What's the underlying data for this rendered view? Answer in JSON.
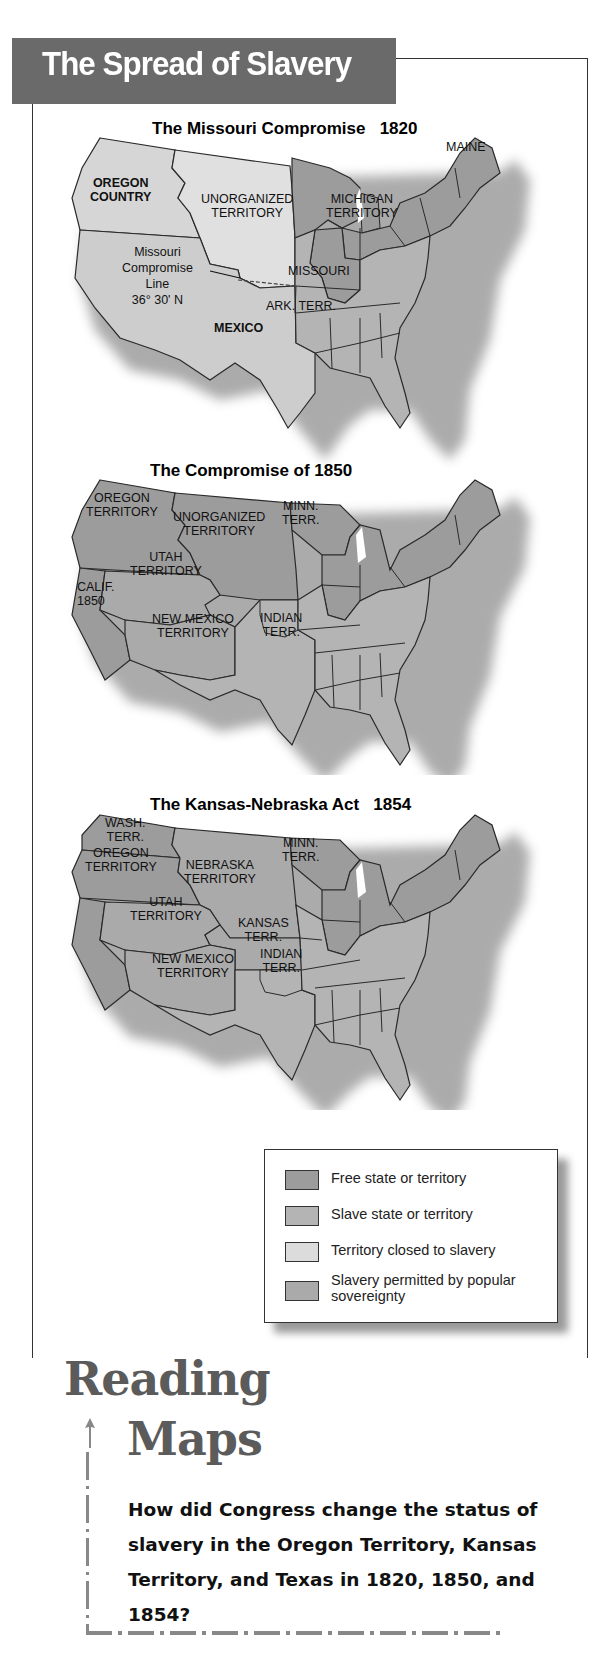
{
  "header": {
    "title": "The Spread of Slavery"
  },
  "colors": {
    "title_bar": "#6a6a6a",
    "free": "#9c9c9c",
    "slave": "#b4b4b4",
    "closed": "#dcdcdc",
    "popular": "#aaaaaa",
    "outline": "#2a2a2a",
    "reading_heading": "#5b5b5b"
  },
  "maps": [
    {
      "title": "The Missouri Compromise   1820",
      "labels": {
        "maine": "MAINE",
        "oregon": "OREGON\nCOUNTRY",
        "unorganized": "UNORGANIZED\nTERRITORY",
        "michigan": "MICHIGAN\nTERRITORY",
        "compromise_line": "Missouri\nCompromise\nLine\n36° 30' N",
        "missouri": "MISSOURI",
        "ark": "ARK. TERR.",
        "mexico": "MEXICO"
      }
    },
    {
      "title": "The Compromise of 1850",
      "labels": {
        "oregon": "OREGON\nTERRITORY",
        "unorganized": "UNORGANIZED\nTERRITORY",
        "minn": "MINN.\nTERR.",
        "utah": "UTAH\nTERRITORY",
        "calif": "CALIF.\n1850",
        "new_mexico": "NEW MEXICO\nTERRITORY",
        "indian": "INDIAN\nTERR."
      }
    },
    {
      "title": "The Kansas-Nebraska Act   1854",
      "labels": {
        "wash": "WASH.\nTERR.",
        "oregon": "OREGON\nTERRITORY",
        "nebraska": "NEBRASKA\nTERRITORY",
        "minn": "MINN.\nTERR.",
        "utah": "UTAH\nTERRITORY",
        "kansas": "KANSAS\nTERR.",
        "indian": "INDIAN\nTERR.",
        "new_mexico": "NEW MEXICO\nTERRITORY"
      }
    }
  ],
  "legend": {
    "items": [
      {
        "label": "Free state or territory",
        "color": "#9c9c9c"
      },
      {
        "label": "Slave state or territory",
        "color": "#b4b4b4"
      },
      {
        "label": "Territory closed to slavery",
        "color": "#dcdcdc"
      },
      {
        "label": "Slavery permitted by popular sovereignty",
        "color": "#aaaaaa"
      }
    ]
  },
  "reading_maps": {
    "heading_line1": "Reading",
    "heading_line2": "Maps",
    "question": "How did Congress change the status of slavery in the Oregon Territory, Kansas Territory, and Texas in 1820, 1850, and 1854?"
  }
}
